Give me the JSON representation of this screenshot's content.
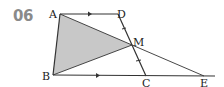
{
  "problem_number": "06",
  "points": {
    "A": {
      "label": "A",
      "x": 60,
      "y": 14
    },
    "D": {
      "label": "D",
      "x": 118,
      "y": 14
    },
    "M": {
      "label": "M",
      "x": 132,
      "y": 45
    },
    "B": {
      "label": "B",
      "x": 53,
      "y": 75
    },
    "C": {
      "label": "C",
      "x": 146,
      "y": 76
    },
    "E": {
      "label": "E",
      "x": 204,
      "y": 76
    }
  },
  "colors": {
    "shade": "#c8c8c8",
    "line": "#333333",
    "number": "#8a8a8a"
  }
}
